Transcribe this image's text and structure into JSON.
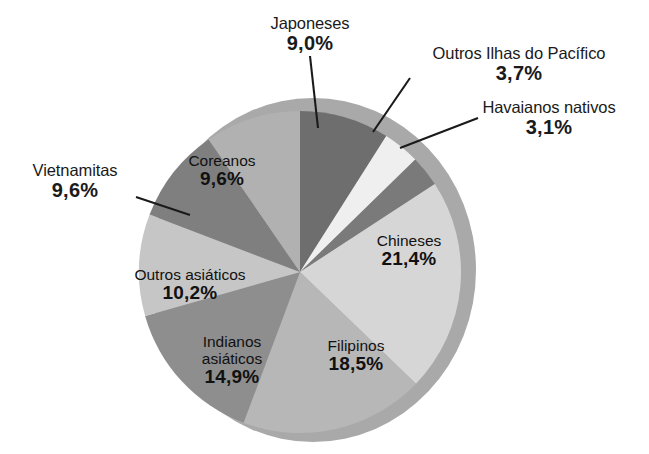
{
  "chart_data": {
    "type": "pie",
    "title": "",
    "subtitle": "",
    "xlabel": "",
    "ylabel": "",
    "legend_position": "none",
    "grid": false,
    "value_unit": "percent",
    "decimal_separator": ",",
    "categories": [
      "Japoneses",
      "Outros Ilhas do Pacífico",
      "Havaianos nativos",
      "Chineses",
      "Filipinos",
      "Indianos asiáticos",
      "Outros asiáticos",
      "Vietnamitas",
      "Coreanos"
    ],
    "values": [
      9.0,
      3.7,
      3.1,
      21.4,
      18.5,
      14.9,
      10.2,
      9.6,
      9.6
    ],
    "value_labels": [
      "9,0%",
      "3,7%",
      "3,1%",
      "21,4%",
      "18,5%",
      "14,9%",
      "10,2%",
      "9,6%",
      "9,6%"
    ],
    "colors": [
      "#6e6e6e",
      "#efefef",
      "#7a7a7a",
      "#d6d6d6",
      "#b7b7b7",
      "#8e8e8e",
      "#c6c6c6",
      "#7f7f7f",
      "#b1b1b1"
    ],
    "slices": [
      {
        "label": "Japoneses",
        "value": 9.0,
        "value_label": "9,0%",
        "color": "#6e6e6e",
        "label_placement": "callout"
      },
      {
        "label": "Outros Ilhas do Pacífico",
        "value": 3.7,
        "value_label": "3,7%",
        "color": "#efefef",
        "label_placement": "callout"
      },
      {
        "label": "Havaianos nativos",
        "value": 3.1,
        "value_label": "3,1%",
        "color": "#7a7a7a",
        "label_placement": "callout"
      },
      {
        "label": "Chineses",
        "value": 21.4,
        "value_label": "21,4%",
        "color": "#d6d6d6",
        "label_placement": "inside"
      },
      {
        "label": "Filipinos",
        "value": 18.5,
        "value_label": "18,5%",
        "color": "#b7b7b7",
        "label_placement": "inside"
      },
      {
        "label": "Indianos asiáticos",
        "value": 14.9,
        "value_label": "14,9%",
        "color": "#8e8e8e",
        "label_placement": "inside"
      },
      {
        "label": "Outros asiáticos",
        "value": 10.2,
        "value_label": "10,2%",
        "color": "#c6c6c6",
        "label_placement": "inside"
      },
      {
        "label": "Vietnamitas",
        "value": 9.6,
        "value_label": "9,6%",
        "color": "#7f7f7f",
        "label_placement": "callout"
      },
      {
        "label": "Coreanos",
        "value": 9.6,
        "value_label": "9,6%",
        "color": "#b1b1b1",
        "label_placement": "inside"
      }
    ],
    "total": 100.0,
    "start_angle_deg": 0,
    "direction": "clockwise"
  },
  "labels": {
    "japoneses": {
      "cat": "Japoneses",
      "pct": "9,0%"
    },
    "outros_pacifico": {
      "cat": "Outros Ilhas do Pacífico",
      "pct": "3,7%"
    },
    "havaianos": {
      "cat": "Havaianos nativos",
      "pct": "3,1%"
    },
    "chineses": {
      "cat": "Chineses",
      "pct": "21,4%"
    },
    "filipinos": {
      "cat": "Filipinos",
      "pct": "18,5%"
    },
    "indianos": {
      "cat1": "Indianos",
      "cat2": "asiáticos",
      "pct": "14,9%"
    },
    "outros_asiaticos": {
      "cat": "Outros asiáticos",
      "pct": "10,2%"
    },
    "vietnamitas": {
      "cat": "Vietnamitas",
      "pct": "9,6%"
    },
    "coreanos": {
      "cat": "Coreanos",
      "pct": "9,6%"
    }
  },
  "style": {
    "background": "#ffffff",
    "text_color": "#1a1a1a",
    "leader_line_color": "#1a1a1a",
    "rim_shadow_color": "#a8a8a8"
  }
}
